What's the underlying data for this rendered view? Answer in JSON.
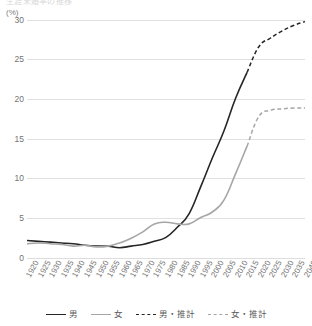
{
  "title_clipped": "生涯未婚率の推移",
  "axis": {
    "unit_label": "(%)",
    "y_ticks": [
      "0",
      "5",
      "10",
      "15",
      "20",
      "25",
      "30"
    ],
    "x_ticks": [
      "1920",
      "1925",
      "1930",
      "1935",
      "1940",
      "1945",
      "1950",
      "1955",
      "1960",
      "1965",
      "1970",
      "1975",
      "1980",
      "1985",
      "1990",
      "1995",
      "2000",
      "2005",
      "2010",
      "2015",
      "2020",
      "2025",
      "2030",
      "2035",
      "2040"
    ]
  },
  "colors": {
    "male": "#262626",
    "female": "#a6a6a6",
    "male_projection": "#262626",
    "female_projection": "#a6a6a6",
    "grid": "#d9d9d9",
    "text": "#737373"
  },
  "legend": {
    "items": [
      {
        "label": "男",
        "style": "solid",
        "color": "#262626"
      },
      {
        "label": "女",
        "style": "solid",
        "color": "#a6a6a6"
      },
      {
        "label": "男・推計",
        "style": "dashed",
        "color": "#262626"
      },
      {
        "label": "女・推計",
        "style": "dashed",
        "color": "#a6a6a6"
      }
    ]
  },
  "chart_data": {
    "type": "line",
    "title": "生涯未婚率の推移",
    "xlabel": "",
    "ylabel": "(%)",
    "ylim": [
      0,
      30
    ],
    "xlim": [
      "1920",
      "2040"
    ],
    "grid": true,
    "legend_position": "bottom",
    "x": [
      "1920",
      "1925",
      "1930",
      "1935",
      "1940",
      "1945",
      "1950",
      "1955",
      "1960",
      "1965",
      "1970",
      "1975",
      "1980",
      "1985",
      "1990",
      "1995",
      "2000",
      "2005",
      "2010",
      "2015",
      "2020",
      "2025",
      "2030",
      "2035",
      "2040"
    ],
    "series": [
      {
        "name": "男",
        "style": "solid",
        "color": "#262626",
        "values": [
          2.2,
          2.1,
          2.0,
          1.9,
          1.8,
          1.6,
          1.5,
          1.5,
          1.3,
          1.5,
          1.7,
          2.1,
          2.6,
          3.9,
          5.6,
          9.0,
          12.6,
          16.0,
          20.1,
          23.4,
          null,
          null,
          null,
          null,
          null
        ]
      },
      {
        "name": "女",
        "style": "solid",
        "color": "#a6a6a6",
        "values": [
          1.8,
          1.9,
          1.8,
          1.7,
          1.5,
          1.6,
          1.4,
          1.5,
          1.9,
          2.5,
          3.3,
          4.3,
          4.5,
          4.3,
          4.3,
          5.1,
          5.8,
          7.3,
          10.6,
          14.1,
          null,
          null,
          null,
          null,
          null
        ]
      },
      {
        "name": "男・推計",
        "style": "dashed",
        "color": "#262626",
        "values": [
          null,
          null,
          null,
          null,
          null,
          null,
          null,
          null,
          null,
          null,
          null,
          null,
          null,
          null,
          null,
          null,
          null,
          null,
          null,
          23.4,
          26.6,
          27.7,
          28.6,
          29.3,
          29.8
        ]
      },
      {
        "name": "女・推計",
        "style": "dashed",
        "color": "#a6a6a6",
        "values": [
          null,
          null,
          null,
          null,
          null,
          null,
          null,
          null,
          null,
          null,
          null,
          null,
          null,
          null,
          null,
          null,
          null,
          null,
          null,
          14.1,
          17.8,
          18.6,
          18.8,
          18.9,
          18.9
        ]
      }
    ]
  }
}
